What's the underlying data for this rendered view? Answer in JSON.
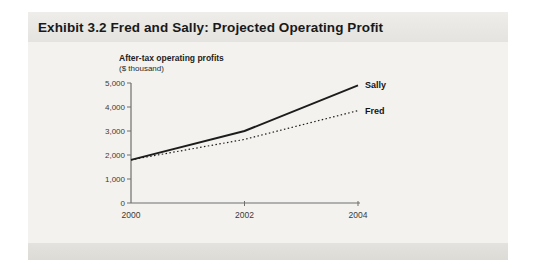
{
  "exhibit": {
    "title": "Exhibit 3.2 Fred and Sally: Projected Operating Profit"
  },
  "chart_data": {
    "type": "line",
    "title": "Exhibit 3.2 Fred and Sally: Projected Operating Profit",
    "ylabel_line1": "After-tax operating profits",
    "ylabel_line2": "($ thousand)",
    "xlabel": "",
    "x": [
      2000,
      2002,
      2004
    ],
    "x_tick_labels": [
      "2000",
      "2002",
      "2004"
    ],
    "xlim": [
      2000,
      2004
    ],
    "y_ticks": [
      0,
      1000,
      2000,
      3000,
      4000,
      5000
    ],
    "y_tick_labels": [
      "0",
      "1,000",
      "2,000",
      "3,000",
      "4,000",
      "5,000"
    ],
    "ylim": [
      0,
      5000
    ],
    "grid": false,
    "legend_position": "line-end-labels",
    "series": [
      {
        "name": "Sally",
        "style": "solid",
        "values": [
          1800,
          3000,
          4900
        ]
      },
      {
        "name": "Fred",
        "style": "dotted",
        "values": [
          1800,
          2650,
          3850
        ]
      }
    ],
    "colors": {
      "line": "#1c1c1c",
      "axis": "#6e6e6e",
      "tick_text": "#3a3a3a",
      "panel_body": "#f3f2ee",
      "panel_header": "#e6e5e1",
      "panel_footer": "#deddd8"
    }
  }
}
